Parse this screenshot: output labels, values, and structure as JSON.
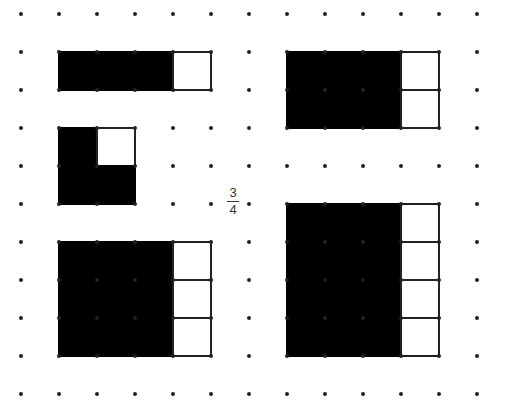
{
  "grid": {
    "origin_x": 21,
    "origin_y": 14,
    "spacing": 38,
    "cols": 13,
    "rows": 11,
    "dot_color": "#222222",
    "dot_radius": 2
  },
  "fraction": {
    "numerator": "3",
    "denominator": "4"
  },
  "colors": {
    "fill": "#000000",
    "empty": "#ffffff",
    "stroke": "#222222"
  },
  "shapes": [
    {
      "name": "shape-bar-1x4",
      "col": 1,
      "row": 1,
      "width": 4,
      "height": 1,
      "filled_cols": 3,
      "empty_cells": []
    },
    {
      "name": "shape-rect-4x2",
      "col": 7,
      "row": 1,
      "width": 4,
      "height": 2,
      "filled_cols": 3,
      "empty_cells": []
    },
    {
      "name": "shape-square-2x2",
      "col": 1,
      "row": 3,
      "width": 2,
      "height": 2,
      "filled_cols": 2,
      "empty_cells": [
        [
          1,
          0
        ]
      ]
    },
    {
      "name": "shape-rect-4x3",
      "col": 1,
      "row": 6,
      "width": 4,
      "height": 3,
      "filled_cols": 3,
      "empty_cells": []
    },
    {
      "name": "shape-rect-4x4",
      "col": 7,
      "row": 5,
      "width": 4,
      "height": 4,
      "filled_cols": 3,
      "empty_cells": []
    }
  ]
}
